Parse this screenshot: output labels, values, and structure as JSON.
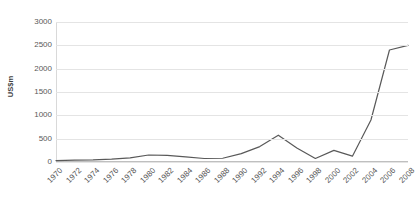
{
  "chart_data": {
    "type": "line",
    "title": "",
    "xlabel": "",
    "ylabel": "US$m",
    "ylim": [
      0,
      3000
    ],
    "ytick_step": 500,
    "yticks": [
      "0",
      "500",
      "1000",
      "1500",
      "2000",
      "2500",
      "3000"
    ],
    "grid": true,
    "legend": false,
    "line_color": "#595959",
    "grid_color": "#e4e4e4",
    "categories": [
      "1970",
      "1972",
      "1974",
      "1976",
      "1978",
      "1980",
      "1982",
      "1984",
      "1986",
      "1988",
      "1990",
      "1992",
      "1994",
      "1996",
      "1998",
      "2000",
      "2002",
      "2004",
      "2006",
      "2008"
    ],
    "values": [
      30,
      40,
      45,
      60,
      90,
      150,
      140,
      110,
      75,
      80,
      180,
      330,
      575,
      300,
      75,
      250,
      125,
      900,
      2400,
      2500
    ]
  }
}
